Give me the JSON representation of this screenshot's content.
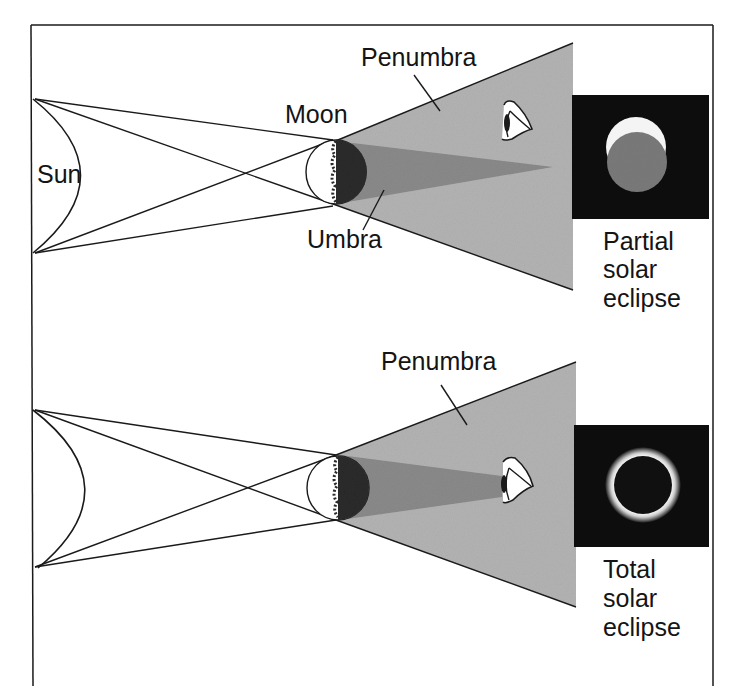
{
  "diagram": {
    "top_panel": {
      "labels": {
        "sun": "Sun",
        "moon": "Moon",
        "penumbra": "Penumbra",
        "umbra": "Umbra"
      },
      "caption": [
        "Partial",
        "solar",
        "eclipse"
      ]
    },
    "bottom_panel": {
      "labels": {
        "penumbra": "Penumbra"
      },
      "caption": [
        "Total",
        "solar",
        "eclipse"
      ]
    },
    "colors": {
      "penumbra": "#b3b3b3",
      "umbra": "#8a8a8a",
      "moon_dark": "#2a2a2a",
      "eclipse_background": "#101010",
      "partial_moon_disk": "#7a7a7a",
      "line": "#1a1a1a"
    }
  }
}
